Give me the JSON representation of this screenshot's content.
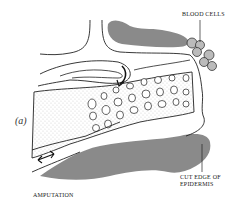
{
  "figure": {
    "panel_label": "(a)",
    "labels": {
      "blood_cells": "BLOOD CELLS",
      "cut_edge_line1": "CUT EDGE OF",
      "cut_edge_line2": "EPIDERMIS",
      "amputation": "AMPUTATION"
    },
    "colors": {
      "epidermis_gray": "#8a8a8a",
      "line": "#222222",
      "background": "#ffffff"
    }
  }
}
